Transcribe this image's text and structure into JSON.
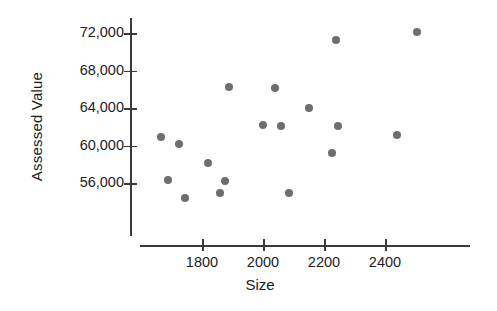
{
  "chart_data": {
    "type": "scatter",
    "title": "",
    "xlabel": "Size",
    "ylabel": "Assessed Value",
    "xlim": [
      1630,
      2560
    ],
    "ylim": [
      53400,
      73800
    ],
    "grid": false,
    "legend": null,
    "xticks": [
      1800,
      2000,
      2200,
      2400
    ],
    "xtick_labels": [
      "1800",
      "2000",
      "2200",
      "2400"
    ],
    "yticks": [
      56000,
      60000,
      64000,
      68000,
      72000
    ],
    "ytick_labels": [
      "56,000",
      "60,000",
      "64,000",
      "68,000",
      "72,000"
    ],
    "marker_color": "#6e6e6e",
    "axis_color": "#3a3a3a",
    "background": "#ffffff",
    "points": [
      {
        "x": 1665,
        "y": 60900
      },
      {
        "x": 1690,
        "y": 56300
      },
      {
        "x": 1725,
        "y": 60200
      },
      {
        "x": 1745,
        "y": 54400
      },
      {
        "x": 1820,
        "y": 58100
      },
      {
        "x": 1860,
        "y": 54900
      },
      {
        "x": 1875,
        "y": 56200
      },
      {
        "x": 1890,
        "y": 66200
      },
      {
        "x": 2000,
        "y": 62200
      },
      {
        "x": 2040,
        "y": 66100
      },
      {
        "x": 2060,
        "y": 62100
      },
      {
        "x": 2085,
        "y": 54900
      },
      {
        "x": 2150,
        "y": 64000
      },
      {
        "x": 2225,
        "y": 59200
      },
      {
        "x": 2240,
        "y": 71300
      },
      {
        "x": 2245,
        "y": 62100
      },
      {
        "x": 2440,
        "y": 61100
      },
      {
        "x": 2505,
        "y": 72100
      }
    ]
  }
}
